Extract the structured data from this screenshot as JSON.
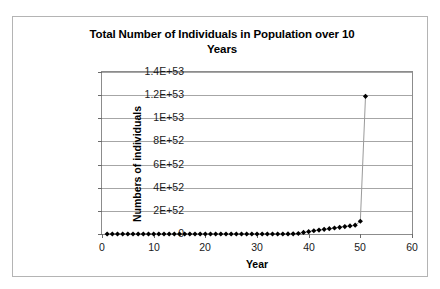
{
  "chart_data": {
    "type": "line",
    "title": "Total Number of Individuals in Population over 10 Years",
    "title_line1": "Total Number of Individuals in Population over 10",
    "title_line2": "Years",
    "xlabel": "Year",
    "ylabel": "Numbers of individuals",
    "xlim": [
      0,
      60
    ],
    "ylim": [
      0,
      1.4e+53
    ],
    "xticks": [
      0,
      10,
      20,
      30,
      40,
      50,
      60
    ],
    "xtick_labels": [
      "0",
      "10",
      "20",
      "30",
      "40",
      "50",
      "60"
    ],
    "yticks": [
      0,
      2e+52,
      4e+52,
      6e+52,
      8e+52,
      1e+53,
      1.2e+53,
      1.4e+53
    ],
    "ytick_labels": [
      "0",
      "2E+52",
      "4E+52",
      "6E+52",
      "8E+52",
      "1E+53",
      "1.2E+53",
      "1.4E+53"
    ],
    "grid": "horizontal",
    "legend": "none",
    "marker": "diamond",
    "marker_color": "#000000",
    "line_color": "#9a9a9a",
    "series": [
      {
        "name": "Total individuals",
        "x": [
          1,
          2,
          3,
          4,
          5,
          6,
          7,
          8,
          9,
          10,
          11,
          12,
          13,
          14,
          15,
          16,
          17,
          18,
          19,
          20,
          21,
          22,
          23,
          24,
          25,
          26,
          27,
          28,
          29,
          30,
          31,
          32,
          33,
          34,
          35,
          36,
          37,
          38,
          39,
          40,
          41,
          42,
          43,
          44,
          45,
          46,
          47,
          48,
          49,
          50,
          51
        ],
        "values": [
          100.0,
          3000.0,
          90000.0,
          2700000.0,
          81000000.0,
          2400000000.0,
          73000000000.0,
          2200000000000.0,
          66000000000000.0,
          2000000000000000.0,
          5.9e+16,
          1.8e+18,
          5.3e+19,
          1.6e+21,
          4.8e+22,
          1.4e+24,
          4.3e+25,
          1.3e+27,
          3.9e+28,
          1.2e+30,
          3.5e+31,
          1e+33,
          3.1e+34,
          9.4e+35,
          2.8e+37,
          8.5e+38,
          2.5e+40,
          7.6e+41,
          2.3e+43,
          6.9e+44,
          2.1e+46,
          6.2e+47,
          1.9e+48,
          5.6e+48,
          1.7e+49,
          5e+49,
          1.5e+50,
          4.5e+50,
          1.4e+51,
          2e+51,
          2.8e+51,
          3.4e+51,
          4e+51,
          4.6e+51,
          5.2e+51,
          5.8e+51,
          6.4e+51,
          7e+51,
          7.6e+51,
          1.1e+52,
          1.19e+53
        ]
      }
    ]
  },
  "axes": {
    "y_title": "Numbers of individuals",
    "x_title": "Year"
  }
}
